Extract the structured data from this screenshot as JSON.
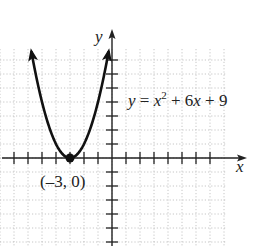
{
  "chart_data": {
    "type": "line",
    "title": "",
    "xlabel": "x",
    "ylabel": "y",
    "equation": {
      "lhs": "y",
      "eq": " = ",
      "var": "x",
      "exp": "2",
      "rest": " + 6",
      "var2": "x",
      "tail": " + 9",
      "text": "y = x^2 + 6x + 9"
    },
    "function": "y = x^2 + 6x + 9",
    "vertex": {
      "x": -3,
      "y": 0,
      "label": "(–3, 0)"
    },
    "xlim": [
      -8,
      9.5
    ],
    "ylim": [
      -6.3,
      8.2
    ],
    "x_ticks": [
      -7,
      -6,
      -5,
      -4,
      -3,
      -2,
      -1,
      1,
      2,
      3,
      4,
      5,
      6,
      7
    ],
    "y_ticks": [
      -6,
      -5,
      -4,
      -3,
      -2,
      -1,
      1,
      2,
      3,
      4,
      5,
      6,
      7
    ],
    "grid": true,
    "grid_style": "dotted",
    "curve_domain": [
      -5.75,
      -0.25
    ],
    "series": [
      {
        "name": "y = x^2 + 6x + 9",
        "x": [
          -5.75,
          -5,
          -4,
          -3,
          -2,
          -1,
          -0.25
        ],
        "y": [
          7.56,
          4,
          1,
          0,
          1,
          4,
          7.56
        ]
      }
    ],
    "legend": "none"
  },
  "colors": {
    "curve": "#111111",
    "axis": "#222222",
    "grid": "#b8b8b8",
    "background": "#ffffff"
  },
  "layout": {
    "origin_px": [
      112,
      158
    ],
    "unit_px": 14,
    "grid_px": {
      "left": 0,
      "top": 49,
      "right": 226,
      "bottom": 246
    }
  }
}
